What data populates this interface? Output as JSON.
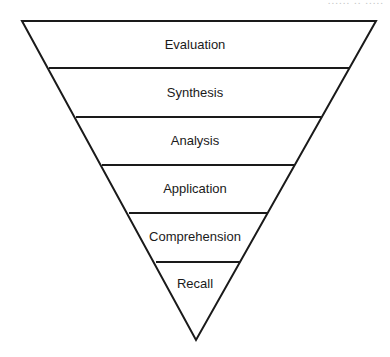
{
  "diagram": {
    "type": "inverted-pyramid",
    "title": "",
    "top_cutoff_text": "...... .. .....",
    "stroke_color": "#1a1a1a",
    "fill_color": "#ffffff",
    "levels": [
      {
        "label": "Evaluation"
      },
      {
        "label": "Synthesis"
      },
      {
        "label": "Analysis"
      },
      {
        "label": "Application"
      },
      {
        "label": "Comprehension"
      },
      {
        "label": "Recall"
      }
    ]
  }
}
